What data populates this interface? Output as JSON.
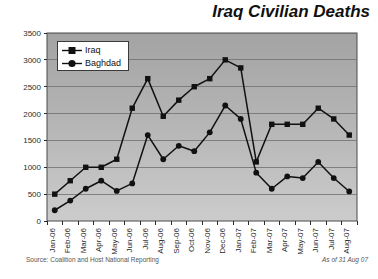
{
  "chart_data": {
    "type": "line",
    "title": "Iraq Civilian Deaths",
    "xlabel": "",
    "ylabel": "",
    "ylim": [
      0,
      3500
    ],
    "ytick_step": 500,
    "yticks": [
      "0",
      "500",
      "1000",
      "1500",
      "2000",
      "2500",
      "3000",
      "3500"
    ],
    "grid": true,
    "legend_position": "top-left-inside",
    "categories": [
      "Jan-06",
      "Feb-06",
      "Mar-06",
      "Apr-06",
      "May-06",
      "Jun-06",
      "Jul-06",
      "Aug-06",
      "Sep-06",
      "Oct-06",
      "Nov-06",
      "Dec-06",
      "Jan-07",
      "Feb-07",
      "Mar-07",
      "Apr-07",
      "May-07",
      "Jun-07",
      "Jul-07",
      "Aug-07"
    ],
    "series": [
      {
        "name": "Iraq",
        "marker": "square",
        "color": "#111111",
        "values": [
          500,
          750,
          1000,
          1000,
          1150,
          2100,
          2650,
          1950,
          2250,
          2500,
          2650,
          3000,
          2850,
          1100,
          1800,
          1800,
          1800,
          2100,
          1900,
          1600
        ]
      },
      {
        "name": "Baghdad",
        "marker": "circle",
        "color": "#111111",
        "values": [
          200,
          380,
          600,
          750,
          560,
          700,
          1600,
          1150,
          1400,
          1300,
          1650,
          2150,
          1900,
          900,
          600,
          830,
          800,
          1100,
          800,
          550
        ]
      }
    ],
    "annotations": {
      "source": "Source: Coalition and Host National Reporting",
      "as_of": "As of 31 Aug 07"
    }
  },
  "legend": {
    "items": [
      {
        "label": "Iraq"
      },
      {
        "label": "Baghdad"
      }
    ]
  },
  "colors": {
    "plot_background_top": "#a6a6a6",
    "plot_background_bottom": "#c9c9c9",
    "grid": "#6f6f6f",
    "axis": "#2b2b2b",
    "line": "#111111",
    "title": "#111111",
    "note": "#555555"
  }
}
